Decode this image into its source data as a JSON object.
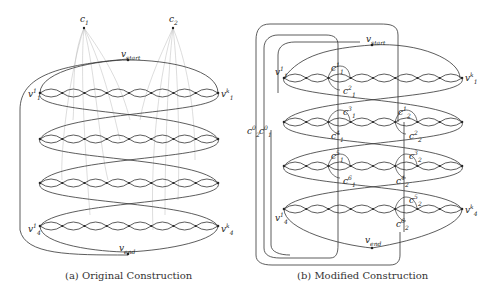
{
  "figure": {
    "panels": [
      {
        "id": "a",
        "caption": "(a) Original Construction",
        "clause_nodes": [
          {
            "name": "c",
            "sub": "1"
          },
          {
            "name": "c",
            "sub": "2"
          }
        ],
        "start_label": {
          "name": "v",
          "sub": "start"
        },
        "end_label": {
          "name": "v",
          "sub": "end"
        },
        "row_labels": [
          {
            "left": {
              "name": "v",
              "sub": "1",
              "sup": "1"
            },
            "right": {
              "name": "v",
              "sub": "1",
              "sup": "k"
            }
          },
          {
            "left": {
              "name": "v",
              "sub": "4",
              "sup": "1"
            },
            "right": {
              "name": "v",
              "sub": "4",
              "sup": "k"
            }
          }
        ],
        "rows": 4,
        "links_per_row": 8
      },
      {
        "id": "b",
        "caption": "(b) Modified Construction",
        "start_label": {
          "name": "v",
          "sub": "start"
        },
        "end_label": {
          "name": "v",
          "sub": "end"
        },
        "side_labels": [
          {
            "name": "c",
            "sub": "2",
            "sup": "0"
          },
          {
            "name": "c",
            "sub": "1",
            "sup": "0"
          }
        ],
        "row_labels": [
          {
            "left": {
              "name": "v",
              "sub": "1",
              "sup": "1"
            },
            "right": {
              "name": "v",
              "sub": "1",
              "sup": "k"
            }
          },
          {
            "left": {
              "name": "v",
              "sub": "4",
              "sup": "1"
            },
            "right": {
              "name": "v",
              "sub": "4",
              "sup": "k"
            }
          }
        ],
        "clause_copies": [
          {
            "name": "c",
            "sub": "1",
            "sup": "1"
          },
          {
            "name": "c",
            "sub": "1",
            "sup": "2"
          },
          {
            "name": "c",
            "sub": "1",
            "sup": "3"
          },
          {
            "name": "c",
            "sub": "1",
            "sup": "4"
          },
          {
            "name": "c",
            "sub": "1",
            "sup": "5"
          },
          {
            "name": "c",
            "sub": "1",
            "sup": "6"
          },
          {
            "name": "c",
            "sub": "2",
            "sup": "1"
          },
          {
            "name": "c",
            "sub": "2",
            "sup": "2"
          },
          {
            "name": "c",
            "sub": "2",
            "sup": "3"
          },
          {
            "name": "c",
            "sub": "2",
            "sup": "4"
          },
          {
            "name": "c",
            "sub": "2",
            "sup": "5"
          },
          {
            "name": "c",
            "sub": "2",
            "sup": "6"
          }
        ],
        "rows": 4,
        "links_per_row": 8
      }
    ]
  }
}
